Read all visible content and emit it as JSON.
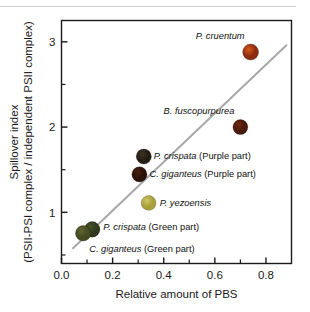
{
  "chart_data": {
    "type": "scatter",
    "title": "",
    "xlabel": "Relative amount of PBS",
    "ylabel_line1": "Spillover index",
    "ylabel_line2": "(PSII-PSI complex / independent PSII complex)",
    "xlim": [
      0.0,
      0.9
    ],
    "ylim": [
      0.4,
      3.25
    ],
    "xticks": [
      "0.0",
      "0.2",
      "0.4",
      "0.6",
      "0.8"
    ],
    "xtick_values": [
      0.0,
      0.2,
      0.4,
      0.6,
      0.8
    ],
    "yticks": [
      "1",
      "2",
      "3"
    ],
    "ytick_values": [
      1,
      2,
      3
    ],
    "grid": false,
    "legend": "none",
    "trendline": {
      "x_start": 0.045,
      "y_start": 0.58,
      "x_end": 0.88,
      "y_end": 2.96,
      "color": "#a8a8a8"
    },
    "points": [
      {
        "label": "P. cruentum",
        "x": 0.74,
        "y": 2.88,
        "color": "#8c2d10",
        "highlight": "#d8581f",
        "radius": 8.0,
        "label_dx": -6,
        "label_dy": -13,
        "label_anchor": "end"
      },
      {
        "label": "B. fuscopurpurea",
        "x": 0.7,
        "y": 2.0,
        "color": "#4a1a0c",
        "highlight": "#6e2a12",
        "radius": 7.5,
        "label_dx": -6,
        "label_dy": -13,
        "label_anchor": "end"
      },
      {
        "label": "P. crispata (Purple part)",
        "x": 0.322,
        "y": 1.655,
        "color": "#231d12",
        "highlight": "#3c3420",
        "radius": 7.6,
        "label_dx": 10,
        "label_dy": 3,
        "label_anchor": "start"
      },
      {
        "label": "C. giganteus (Purple part)",
        "x": 0.305,
        "y": 1.445,
        "color": "#2a1208",
        "highlight": "#4a2211",
        "radius": 7.6,
        "label_dx": 10,
        "label_dy": 3,
        "label_anchor": "start"
      },
      {
        "label": "P. yezoensis",
        "x": 0.341,
        "y": 1.11,
        "color": "#a9a03c",
        "highlight": "#cfc766",
        "radius": 7.4,
        "label_dx": 11,
        "label_dy": 3,
        "label_anchor": "start"
      },
      {
        "label": "P. crispata (Green part)",
        "x": 0.12,
        "y": 0.8,
        "color": "#31391d",
        "highlight": "#49532a",
        "radius": 7.8,
        "label_dx": 11,
        "label_dy": 1,
        "label_anchor": "start"
      },
      {
        "label": "C. giganteus (Green part)",
        "x": 0.085,
        "y": 0.755,
        "color": "#454a22",
        "highlight": "#5d6430",
        "radius": 7.8,
        "label_dx": 6,
        "label_dy": 19,
        "label_anchor": "start"
      }
    ]
  }
}
